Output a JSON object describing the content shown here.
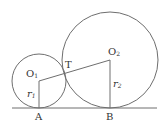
{
  "diagram": {
    "type": "two tangent circles on a common tangent line",
    "colors": {
      "stroke": "#6e6e6e",
      "text": "#333333",
      "background": "#ffffff"
    },
    "baseline": {
      "x1": 12,
      "x2": 157,
      "y": 108
    },
    "circles": [
      {
        "name": "small",
        "center_label": "O1",
        "cx": 39,
        "cy": 81,
        "r": 27
      },
      {
        "name": "large",
        "center_label": "O2",
        "cx": 110,
        "cy": 60,
        "r": 48
      }
    ],
    "segments": [
      {
        "name": "O1-O2",
        "from": "O1",
        "to": "O2"
      },
      {
        "name": "O1-A",
        "from": "O1",
        "to": "A",
        "label": "r1"
      },
      {
        "name": "O2-B",
        "from": "O2",
        "to": "B",
        "label": "r2"
      }
    ],
    "points": {
      "O1": {
        "x": 39,
        "y": 81
      },
      "O2": {
        "x": 110,
        "y": 60
      },
      "T": {
        "x": 65,
        "y": 73
      },
      "A": {
        "x": 39,
        "y": 108
      },
      "B": {
        "x": 110,
        "y": 108
      }
    },
    "labels": {
      "O1": {
        "main": "O",
        "sub": "1"
      },
      "O2": {
        "main": "O",
        "sub": "2"
      },
      "T": "T",
      "A": "A",
      "B": "B",
      "r1": {
        "main": "r",
        "sub": "1"
      },
      "r2": {
        "main": "r",
        "sub": "2"
      }
    }
  }
}
